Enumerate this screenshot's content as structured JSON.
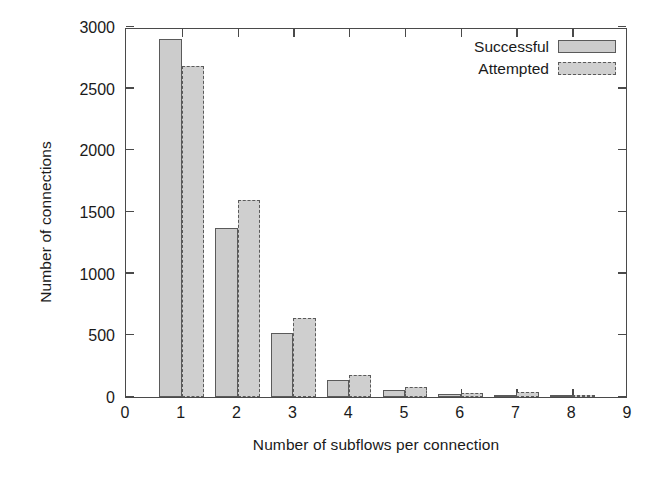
{
  "chart_data": {
    "type": "bar",
    "title": "",
    "xlabel": "Number of subflows per connection",
    "ylabel": "Number of connections",
    "categories": [
      "1",
      "2",
      "3",
      "4",
      "5",
      "6",
      "7",
      "8"
    ],
    "series": [
      {
        "name": "Successful",
        "values": [
          2900,
          1370,
          520,
          140,
          60,
          25,
          15,
          12
        ]
      },
      {
        "name": "Attempted",
        "values": [
          2680,
          1600,
          640,
          175,
          85,
          35,
          40,
          18
        ]
      }
    ],
    "xlim": [
      0,
      9
    ],
    "ylim": [
      0,
      3000
    ],
    "xticks": [
      "0",
      "1",
      "2",
      "3",
      "4",
      "5",
      "6",
      "7",
      "8",
      "9"
    ],
    "yticks": [
      "0",
      "500",
      "1000",
      "1500",
      "2000",
      "2500",
      "3000"
    ],
    "grid": false,
    "legend_position": "top-right",
    "colors": {
      "successful_fill": "#cccccc",
      "attempted_fill": "#cfcfcf",
      "border": "#5a5a5a",
      "axis": "#4a4a4a",
      "background": "#ffffff",
      "text": "#1a1a1a"
    }
  },
  "legend": {
    "entries": [
      {
        "label": "Successful",
        "style": "solid"
      },
      {
        "label": "Attempted",
        "style": "dashed"
      }
    ]
  }
}
